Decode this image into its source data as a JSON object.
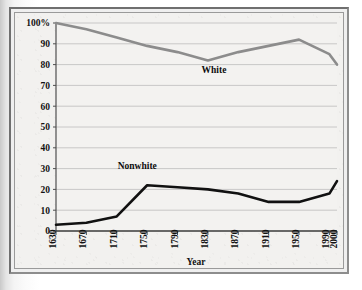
{
  "chart_data": {
    "type": "line",
    "title": "",
    "xlabel": "Year",
    "ylabel": "",
    "x": [
      1630,
      1670,
      1710,
      1750,
      1790,
      1830,
      1870,
      1910,
      1950,
      1990,
      2000
    ],
    "categories": [
      "1630",
      "1670",
      "1710",
      "1750",
      "1790",
      "1830",
      "1870",
      "1910",
      "1950",
      "1990",
      "2000"
    ],
    "xlim": [
      1630,
      2000
    ],
    "ylim": [
      0,
      100
    ],
    "ytick_labels": [
      "0",
      "10",
      "20",
      "30",
      "40",
      "50",
      "60",
      "70",
      "80",
      "90",
      "100%"
    ],
    "yticks": [
      0,
      10,
      20,
      30,
      40,
      50,
      60,
      70,
      80,
      90,
      100
    ],
    "grid": "horizontal",
    "legend": "inline-labels",
    "series": [
      {
        "name": "White",
        "color": "#8c8c8c",
        "label_x": 1838,
        "label_y": 76,
        "values": [
          100,
          97,
          93,
          89,
          86,
          82,
          86,
          89,
          92,
          85,
          80
        ]
      },
      {
        "name": "Nonwhite",
        "color": "#111111",
        "label_x": 1737,
        "label_y": 30,
        "values": [
          3,
          4,
          7,
          22,
          21,
          20,
          18,
          14,
          14,
          18,
          24
        ]
      }
    ]
  },
  "figure": {
    "frame_color": "#6f6f6f",
    "plot_background": "#f2f1ef",
    "gridline_color": "#b9b9b9",
    "axis_color": "#5a5a5a"
  }
}
